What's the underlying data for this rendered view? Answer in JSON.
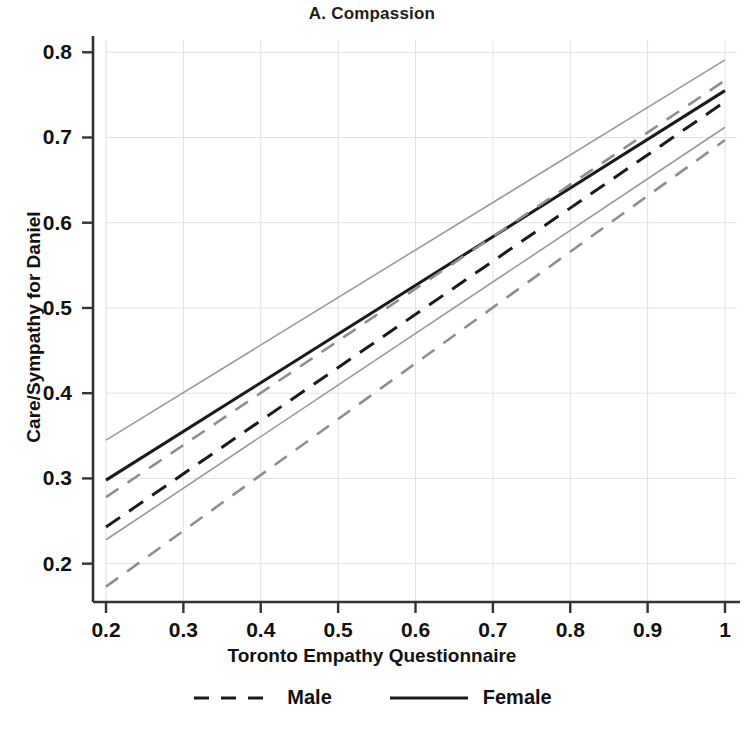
{
  "chart_data": {
    "type": "line",
    "title": "A. Compassion",
    "xlabel": "Toronto Empathy Questionnaire",
    "ylabel": "Care/Sympathy for Daniel",
    "xlim": [
      0.2,
      1.0
    ],
    "ylim": [
      0.155,
      0.805
    ],
    "xticks": [
      0.2,
      0.3,
      0.4,
      0.5,
      0.6,
      0.7,
      0.8,
      0.9,
      1.0
    ],
    "xtick_labels": [
      "0.2",
      "0.3",
      "0.4",
      "0.5",
      "0.6",
      "0.7",
      "0.8",
      "0.9",
      "1"
    ],
    "yticks": [
      0.2,
      0.3,
      0.4,
      0.5,
      0.6,
      0.7,
      0.8
    ],
    "ytick_labels": [
      "0.2",
      "0.3",
      "0.4",
      "0.5",
      "0.6",
      "0.7",
      "0.8"
    ],
    "grid": true,
    "grid_color": "#e2e2e2",
    "legend_position": "bottom-center",
    "series": [
      {
        "name": "Female",
        "style": "solid",
        "color": "#1a1a1a",
        "width": 3.0,
        "x": [
          0.2,
          1.0
        ],
        "values": [
          0.298,
          0.755
        ]
      },
      {
        "name": "Female CI upper",
        "style": "solid",
        "color": "#9a9a9a",
        "width": 1.6,
        "x": [
          0.2,
          1.0
        ],
        "values": [
          0.345,
          0.791
        ]
      },
      {
        "name": "Female CI lower",
        "style": "solid",
        "color": "#9a9a9a",
        "width": 1.6,
        "x": [
          0.2,
          1.0
        ],
        "values": [
          0.228,
          0.712
        ]
      },
      {
        "name": "Male",
        "style": "dashed",
        "color": "#1a1a1a",
        "width": 3.0,
        "x": [
          0.2,
          1.0
        ],
        "values": [
          0.243,
          0.742
        ]
      },
      {
        "name": "Male CI upper",
        "style": "dashed",
        "color": "#8e8e8e",
        "width": 2.6,
        "x": [
          0.2,
          1.0
        ],
        "values": [
          0.278,
          0.767
        ]
      },
      {
        "name": "Male CI lower",
        "style": "dashed",
        "color": "#8e8e8e",
        "width": 2.6,
        "x": [
          0.2,
          1.0
        ],
        "values": [
          0.173,
          0.697
        ]
      }
    ],
    "legend": [
      {
        "label": "Male",
        "style": "dashed",
        "color": "#1a1a1a"
      },
      {
        "label": "Female",
        "style": "solid",
        "color": "#1a1a1a"
      }
    ]
  },
  "axes": {
    "axis_color": "#333333"
  }
}
